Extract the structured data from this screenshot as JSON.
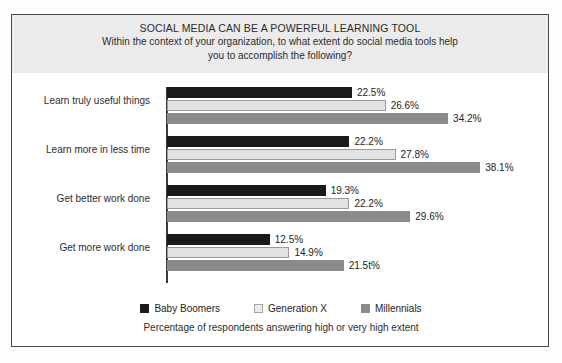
{
  "figure": {
    "title_main": "SOCIAL MEDIA CAN BE A POWERFUL LEARNING TOOL",
    "title_sub_line1": "Within the context of your organization, to what extent do social media tools help",
    "title_sub_line2": "you to accomplish the following?",
    "x_caption": "Percentage of respondents answering high or very high extent"
  },
  "legend": {
    "items": [
      {
        "label": "Baby Boomers",
        "color": "#1a1a1a"
      },
      {
        "label": "Generation X",
        "color": "#ececec"
      },
      {
        "label": "Millennials",
        "color": "#8b8b8b"
      }
    ]
  },
  "chart_data": {
    "type": "bar",
    "orientation": "horizontal",
    "title": "SOCIAL MEDIA CAN BE A POWERFUL LEARNING TOOL",
    "subtitle": "Within the context of your organization, to what extent do social media tools help you to accomplish the following?",
    "xlabel": "Percentage of respondents answering high or very high extent",
    "ylabel": "",
    "xlim": [
      0,
      40
    ],
    "grid": false,
    "legend_position": "bottom",
    "categories": [
      "Learn truly useful things",
      "Learn more in less time",
      "Get better work done",
      "Get more work done"
    ],
    "series": [
      {
        "name": "Baby Boomers",
        "color": "#1a1a1a",
        "values": [
          22.5,
          22.2,
          19.3,
          12.5
        ],
        "labels": [
          "22.5%",
          "22.2%",
          "19.3%",
          "12.5%"
        ]
      },
      {
        "name": "Generation X",
        "color": "#ececec",
        "values": [
          26.6,
          27.8,
          22.2,
          14.9
        ],
        "labels": [
          "26.6%",
          "27.8%",
          "22.2%",
          "14.9%"
        ]
      },
      {
        "name": "Millennials",
        "color": "#8b8b8b",
        "values": [
          34.2,
          38.1,
          29.6,
          21.5
        ],
        "labels": [
          "34.2%",
          "38.1%",
          "29.6%",
          "21.5t%"
        ]
      }
    ]
  }
}
